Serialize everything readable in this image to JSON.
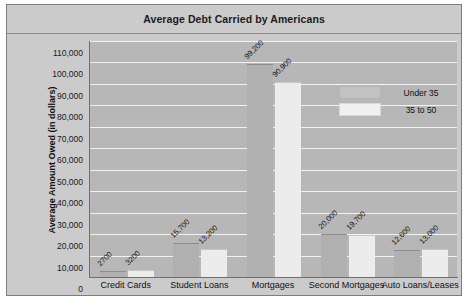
{
  "chart_data": {
    "type": "bar",
    "title": "Average Debt Carried by Americans",
    "xlabel": "",
    "ylabel": "Average Amount Owed (in dollars)",
    "ylim": [
      0,
      110000
    ],
    "ytick_step": 10000,
    "yticks": [
      "0",
      "10,000",
      "20,000",
      "30,000",
      "40,000",
      "50,000",
      "60,000",
      "70,000",
      "80,000",
      "90,000",
      "100,000",
      "110,000"
    ],
    "ytick_values": [
      0,
      10000,
      20000,
      30000,
      40000,
      50000,
      60000,
      70000,
      80000,
      90000,
      100000,
      110000
    ],
    "grid": true,
    "legend_position": "upper-right",
    "categories": [
      "Credit Cards",
      "Student Loans",
      "Mortgages",
      "Second Mortgages",
      "Auto Loans/Leases"
    ],
    "series": [
      {
        "name": "Under 35",
        "color": "#b0b0b0",
        "values": [
          2700,
          15700,
          99200,
          20000,
          12600
        ],
        "labels": [
          "2700",
          "15,700",
          "99,200",
          "20,000",
          "12,600"
        ]
      },
      {
        "name": "35 to 50",
        "color": "#ececec",
        "values": [
          3200,
          13200,
          90900,
          19700,
          13000
        ],
        "labels": [
          "3200",
          "13,200",
          "90,900",
          "19,700",
          "13,000"
        ]
      }
    ]
  }
}
